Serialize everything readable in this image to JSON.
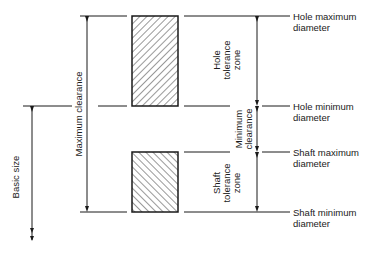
{
  "diagram": {
    "right_labels": {
      "hole_max": [
        "Hole maximum",
        "diameter"
      ],
      "hole_min": [
        "Hole minimum",
        "diameter"
      ],
      "shaft_max": [
        "Shaft maximum",
        "diameter"
      ],
      "shaft_min": [
        "Shaft minimum",
        "diameter"
      ]
    },
    "vertical_labels": {
      "maximum_clearance": "Maximum clearance",
      "basic_size": "Basic size",
      "hole_tolerance_zone": [
        "Hole",
        "tolerance",
        "zone"
      ],
      "minimum_clearance": [
        "Minimum",
        "clearance"
      ],
      "shaft_tolerance_zone": [
        "Shaft",
        "tolerance",
        "zone"
      ]
    },
    "colors": {
      "line": "#1a1a1a",
      "background": "#ffffff"
    }
  }
}
